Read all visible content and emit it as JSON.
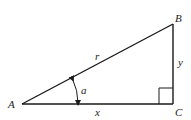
{
  "diagram": {
    "type": "right-triangle",
    "colors": {
      "stroke": "#1a1a1a",
      "text": "#222222",
      "background": "#ffffff"
    },
    "vertices": {
      "A": {
        "label": "A",
        "x": 22,
        "y": 104
      },
      "B": {
        "label": "B",
        "x": 173,
        "y": 24
      },
      "C": {
        "label": "C",
        "x": 173,
        "y": 104
      }
    },
    "sides": {
      "hypotenuse": {
        "label": "r",
        "from": "A",
        "to": "B"
      },
      "vertical": {
        "label": "y",
        "from": "B",
        "to": "C"
      },
      "horizontal": {
        "label": "x",
        "from": "A",
        "to": "C"
      }
    },
    "angle": {
      "label": "a",
      "vertex": "A",
      "arrows": "both-ends"
    },
    "right_angle_marker": {
      "vertex": "C",
      "size": 14
    }
  }
}
